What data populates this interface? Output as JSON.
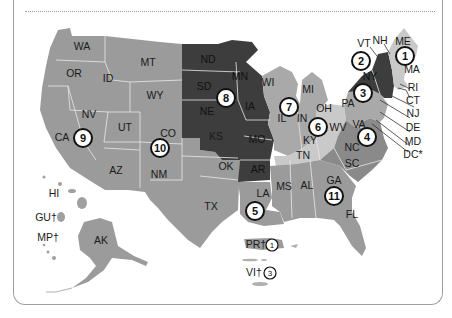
{
  "colors": {
    "shade_light": "#c9c9c9",
    "shade_medium": "#a9a9a9",
    "shade_base": "#9b9b9b",
    "shade_dark": "#3d3d3d",
    "circle_stroke": "#111111",
    "frame": "#a0a0a0"
  },
  "states": {
    "WA": "WA",
    "OR": "OR",
    "CA": "CA",
    "ID": "ID",
    "NV": "NV",
    "MT": "MT",
    "WY": "WY",
    "UT": "UT",
    "AZ": "AZ",
    "CO": "CO",
    "NM": "NM",
    "ND": "ND",
    "SD": "SD",
    "NE": "NE",
    "KS": "KS",
    "OK": "OK",
    "TX": "TX",
    "MN": "MN",
    "IA": "IA",
    "MO": "MO",
    "AR": "AR",
    "LA": "LA",
    "WI": "WI",
    "IL": "IL",
    "MI": "MI",
    "IN": "IN",
    "OH": "OH",
    "KY": "KY",
    "TN": "TN",
    "MS": "MS",
    "AL": "AL",
    "GA": "GA",
    "FL": "FL",
    "SC": "SC",
    "NC": "NC",
    "VA": "VA",
    "WV": "WV",
    "PA": "PA",
    "NY": "NY",
    "VT": "VT",
    "NH": "NH",
    "ME": "ME",
    "MA": "MA",
    "RI": "RI",
    "CT": "CT",
    "NJ": "NJ",
    "DE": "DE",
    "MD": "MD",
    "DC": "DC*",
    "HI": "HI",
    "AK": "AK",
    "GU": "GU†",
    "MP": "MP†",
    "PR": "PR†",
    "VI": "VI†"
  },
  "circuits": {
    "c1": "1",
    "c2": "2",
    "c3": "3",
    "c4": "4",
    "c5": "5",
    "c6": "6",
    "c7": "7",
    "c8": "8",
    "c9": "9",
    "c10": "10",
    "c11": "11",
    "pr": "1",
    "vi": "3"
  }
}
